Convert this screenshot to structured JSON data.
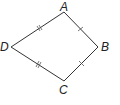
{
  "diagram": {
    "type": "kite",
    "vertices": [
      {
        "label": "A",
        "x": 64,
        "y": 12
      },
      {
        "label": "B",
        "x": 98,
        "y": 47
      },
      {
        "label": "C",
        "x": 64,
        "y": 81
      },
      {
        "label": "D",
        "x": 11,
        "y": 47
      }
    ],
    "sides": [
      {
        "from": "D",
        "to": "A",
        "ticks": 2
      },
      {
        "from": "A",
        "to": "B",
        "ticks": 1
      },
      {
        "from": "B",
        "to": "C",
        "ticks": 1
      },
      {
        "from": "C",
        "to": "D",
        "ticks": 2
      }
    ],
    "stroke_color": "#333333"
  },
  "labels": {
    "a": "A",
    "b": "B",
    "c": "C",
    "d": "D"
  }
}
